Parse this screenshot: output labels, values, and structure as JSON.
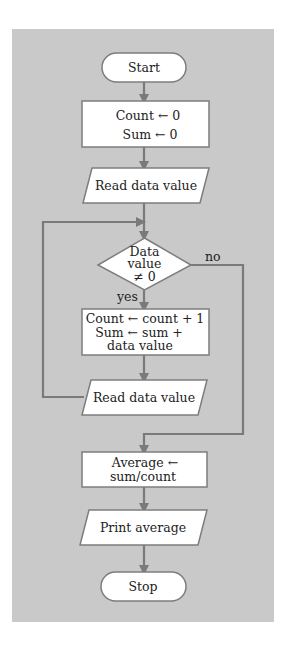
{
  "diagram": {
    "type": "flowchart",
    "colors": {
      "panel": "#c9c9c9",
      "shape_fill": "#ffffff",
      "shape_stroke": "#7d7d7d",
      "connector": "#7a7a7a",
      "text": "#222222"
    },
    "nodes": {
      "start": {
        "shape": "terminal",
        "label": "Start"
      },
      "init": {
        "shape": "process",
        "lines": [
          "Count ← 0",
          "Sum ← 0"
        ]
      },
      "read1": {
        "shape": "input-output",
        "label": "Read data value"
      },
      "decision": {
        "shape": "decision",
        "lines": [
          "Data",
          "value",
          "≠ 0"
        ]
      },
      "update": {
        "shape": "process",
        "lines": [
          "Count ← count + 1",
          "Sum ← sum +",
          "data value"
        ]
      },
      "read2": {
        "shape": "input-output",
        "label": "Read data value"
      },
      "average": {
        "shape": "process",
        "lines": [
          "Average ←",
          "sum/count"
        ]
      },
      "print": {
        "shape": "input-output",
        "label": "Print average"
      },
      "stop": {
        "shape": "terminal",
        "label": "Stop"
      }
    },
    "edge_labels": {
      "yes": "yes",
      "no": "no"
    },
    "edges": [
      {
        "from": "start",
        "to": "init"
      },
      {
        "from": "init",
        "to": "read1"
      },
      {
        "from": "read1",
        "to": "decision"
      },
      {
        "from": "decision",
        "to": "update",
        "label": "yes"
      },
      {
        "from": "update",
        "to": "read2"
      },
      {
        "from": "read2",
        "to": "decision",
        "type": "loop-back"
      },
      {
        "from": "decision",
        "to": "average",
        "label": "no"
      },
      {
        "from": "average",
        "to": "print"
      },
      {
        "from": "print",
        "to": "stop"
      }
    ]
  }
}
